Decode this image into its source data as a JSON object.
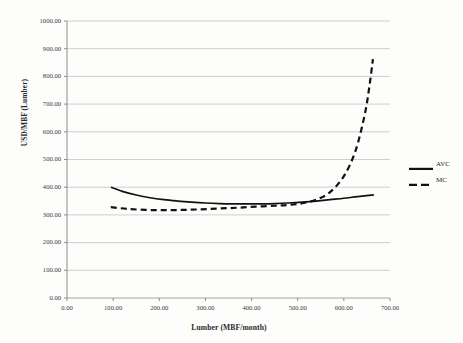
{
  "chart_data": {
    "type": "line",
    "title": "",
    "xlabel": "Lumber  (MBF/month)",
    "ylabel": "USD/MBF (Lumber)",
    "xlim": [
      0,
      700
    ],
    "ylim": [
      0,
      1000
    ],
    "grid": "horizontal",
    "legend_position": "right",
    "xticks": [
      "0.00",
      "100.00",
      "200.00",
      "300.00",
      "400.00",
      "500.00",
      "600.00",
      "700.00"
    ],
    "xtick_values": [
      0,
      100,
      200,
      300,
      400,
      500,
      600,
      700
    ],
    "yticks": [
      "0.00",
      "100.00",
      "200.00",
      "300.00",
      "400.00",
      "500.00",
      "600.00",
      "700.00",
      "800.00",
      "900.00",
      "1000.00"
    ],
    "ytick_values": [
      0,
      100,
      200,
      300,
      400,
      500,
      600,
      700,
      800,
      900,
      1000
    ],
    "series": [
      {
        "name": "AVC",
        "style": "solid",
        "color": "#111111",
        "x": [
          95,
          120,
          150,
          180,
          210,
          240,
          270,
          300,
          330,
          360,
          390,
          420,
          450,
          480,
          510,
          540,
          570,
          600,
          630,
          665
        ],
        "values": [
          400,
          385,
          372,
          362,
          355,
          350,
          346,
          343,
          341,
          340,
          340,
          340,
          341,
          343,
          346,
          350,
          355,
          360,
          366,
          372
        ]
      },
      {
        "name": "MC",
        "style": "dashed",
        "color": "#111111",
        "x": [
          95,
          130,
          170,
          210,
          250,
          290,
          330,
          370,
          410,
          450,
          480,
          510,
          540,
          570,
          600,
          625,
          645,
          655,
          663
        ],
        "values": [
          328,
          322,
          318,
          317,
          318,
          320,
          323,
          326,
          330,
          333,
          336,
          342,
          355,
          382,
          440,
          530,
          660,
          760,
          862
        ]
      }
    ],
    "legend": [
      {
        "label": "AVC",
        "style": "solid"
      },
      {
        "label": "MC",
        "style": "dashed"
      }
    ]
  }
}
